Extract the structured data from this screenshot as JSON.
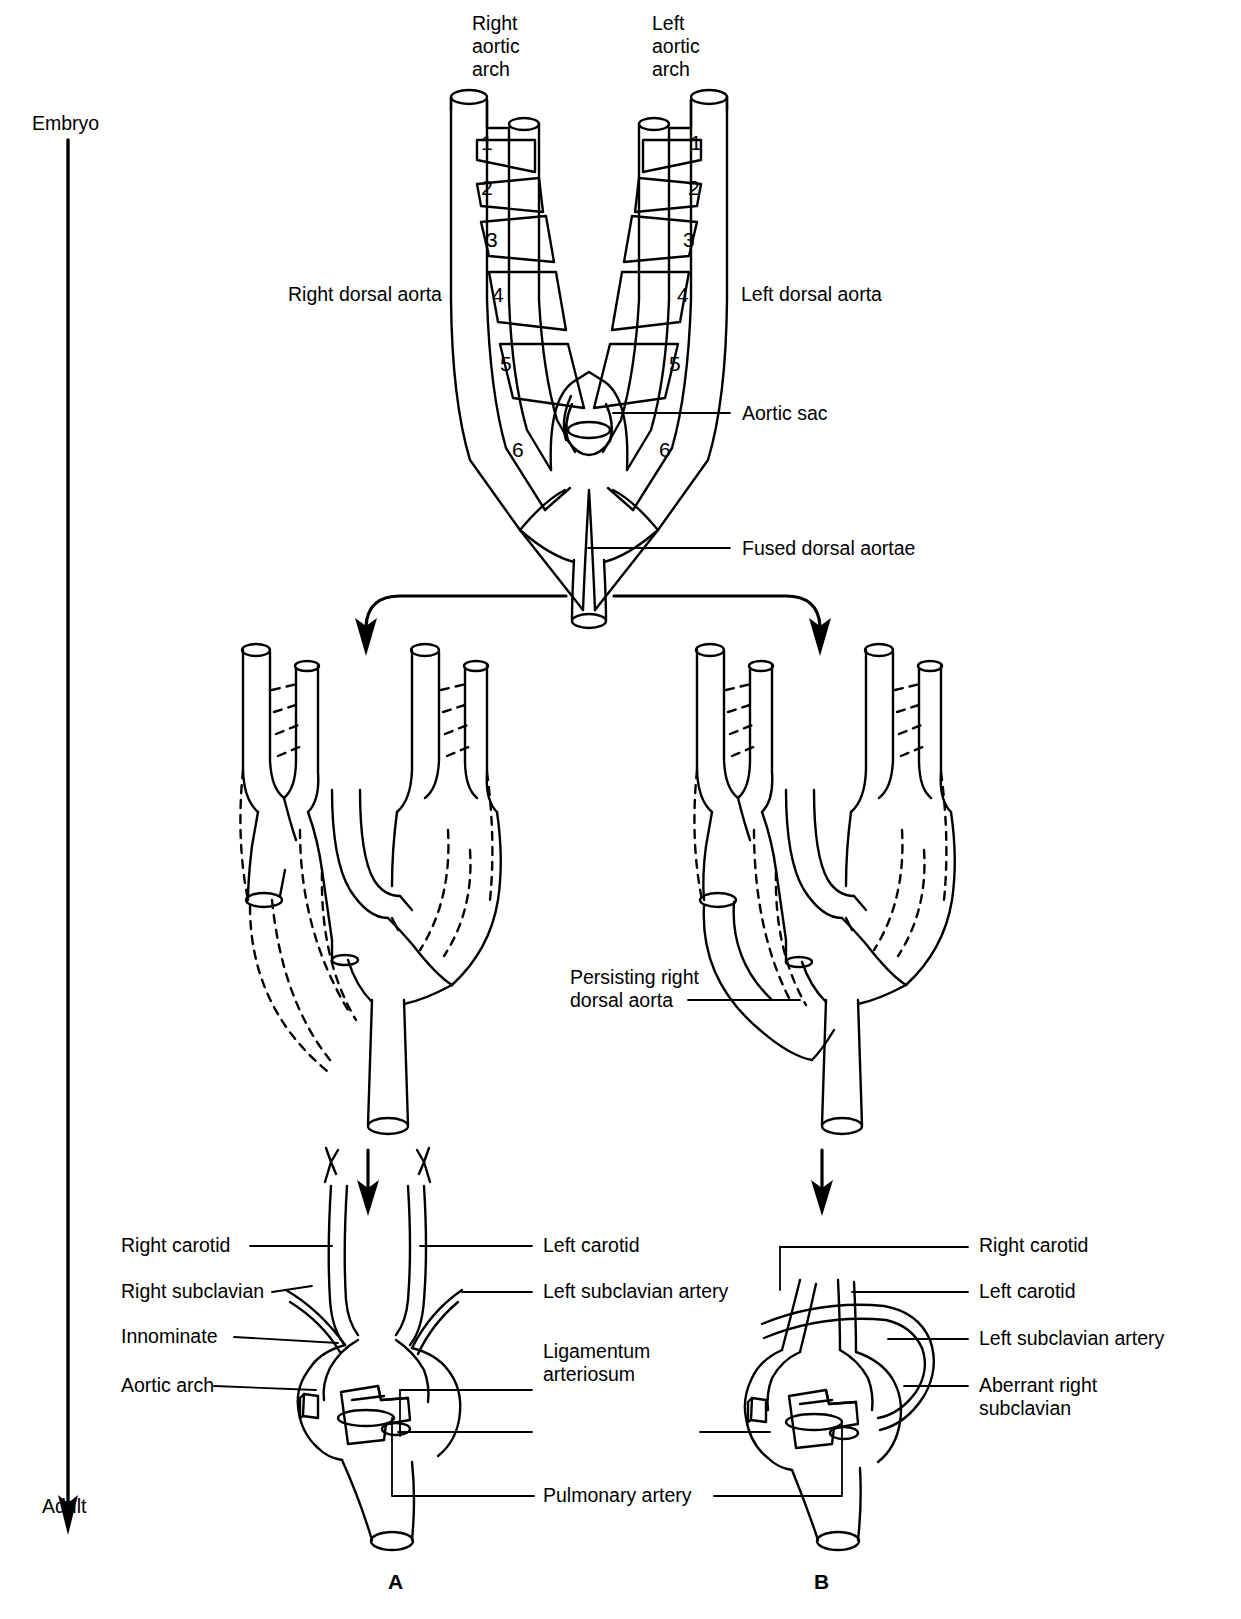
{
  "figure": {
    "timeline": {
      "start": "Embryo",
      "end": "Adult"
    },
    "panel_letters": {
      "a": "A",
      "b": "B"
    }
  },
  "embryo_stage": {
    "labels": {
      "right_arch": "Right\naortic\narch",
      "left_arch": "Left\naortic\narch",
      "right_dorsal_aorta": "Right dorsal aorta",
      "left_dorsal_aorta": "Left dorsal aorta",
      "aortic_sac": "Aortic sac",
      "fused_dorsal_aortae": "Fused dorsal aortae"
    },
    "arch_numbers": [
      "1",
      "2",
      "3",
      "4",
      "5",
      "6"
    ]
  },
  "intermediate_stage": {
    "labels": {
      "persisting_right_dorsal_aorta": "Persisting right\ndorsal aorta"
    }
  },
  "panel_a": {
    "left_labels": [
      "Right carotid",
      "Right subclavian",
      "Innominate",
      "Aortic arch"
    ],
    "right_labels": [
      "Left carotid",
      "Left subclavian artery",
      "Ligamentum\narteriosum",
      "Pulmonary artery"
    ]
  },
  "panel_b": {
    "right_labels": [
      "Right carotid",
      "Left carotid",
      "Left subclavian artery",
      "Aberrant right\nsubclavian"
    ]
  },
  "colors": {
    "ink": "#000000",
    "paper": "#ffffff"
  }
}
